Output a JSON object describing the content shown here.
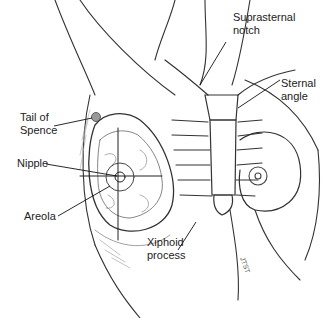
{
  "figure": {
    "labels": {
      "tail_of_spence": [
        "Tail of",
        "Spence"
      ],
      "nipple": "Nipple",
      "areola": "Areola",
      "suprasternal_notch": [
        "Suprasternal",
        "notch"
      ],
      "sternal_angle": [
        "Sternal",
        "angle"
      ],
      "xiphoid_process": [
        "Xiphoid",
        "process"
      ]
    },
    "signature": "JTST"
  }
}
